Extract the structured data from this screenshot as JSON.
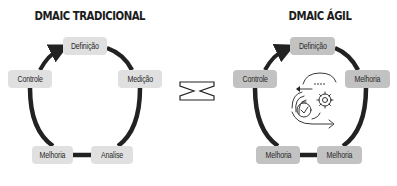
{
  "colors": {
    "line": "#222222",
    "node_traditional": "#e0e0e0",
    "node_agile": "#c2c2c2",
    "text": "#2a2a2a"
  },
  "traditional": {
    "title": "DMAIC TRADICIONAL",
    "nodes": [
      {
        "label": "Definição",
        "position": "top"
      },
      {
        "label": "Medição",
        "position": "right"
      },
      {
        "label": "Analise",
        "position": "bottom-right"
      },
      {
        "label": "Melhoria",
        "position": "bottom-left"
      },
      {
        "label": "Controle",
        "position": "left"
      }
    ]
  },
  "agile": {
    "title": "DMAIC ÁGIL",
    "center_icon": "agile-cycle-clock-gear-icon",
    "nodes": [
      {
        "label": "Definição",
        "position": "top"
      },
      {
        "label": "Melhoria",
        "position": "right"
      },
      {
        "label": "Melhoria",
        "position": "bottom-right"
      },
      {
        "label": "Melhoria",
        "position": "bottom-left"
      },
      {
        "label": "Controle",
        "position": "left"
      }
    ]
  },
  "comparison_icon": "versus-icon"
}
